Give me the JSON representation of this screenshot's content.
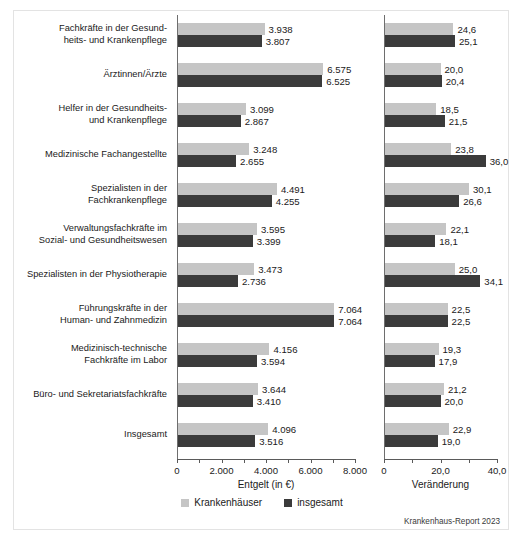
{
  "chart_data": {
    "type": "bar",
    "orientation": "horizontal",
    "title": "",
    "source": "Krankenhaus-Report 2023",
    "legend": {
      "position": "bottom-center",
      "entries": [
        {
          "name": "Krankenhäuser",
          "color": "#c5c5c5"
        },
        {
          "name": "insgesamt",
          "color": "#3b3b3b"
        }
      ]
    },
    "categories": [
      "Fachkräfte in der Gesund-\nheits- und Krankenpflege",
      "Ärztinnen/Ärzte",
      "Helfer in der Gesundheits-\nund Krankenpflege",
      "Medizinische Fachangestellte",
      "Spezialisten in der\nFachkrankenpflege",
      "Verwaltungsfachkräfte im\nSozial- und Gesundheitswesen",
      "Spezialisten in der Physiotherapie",
      "Führungskräfte in der\nHuman- und Zahnmedizin",
      "Medizinisch-technische\nFachkräfte im Labor",
      "Büro- und Sekretariatsfachkräfte",
      "Insgesamt"
    ],
    "panels": [
      {
        "id": "entgelt",
        "xlabel": "Entgelt (in €)",
        "xlim": [
          0,
          8000
        ],
        "major_ticks": [
          0,
          2000,
          4000,
          6000,
          8000
        ],
        "major_tick_labels": [
          "0",
          "2.000",
          "4.000",
          "6.000",
          "8.000"
        ],
        "minor_ticks": [
          1000,
          3000,
          5000,
          7000
        ],
        "grid": false,
        "series": [
          {
            "name": "Krankenhäuser",
            "color": "#c5c5c5",
            "values": [
              3938,
              6575,
              3099,
              3248,
              4491,
              3595,
              3473,
              7064,
              4156,
              3644,
              4096
            ],
            "labels": [
              "3.938",
              "6.575",
              "3.099",
              "3.248",
              "4.491",
              "3.595",
              "3.473",
              "7.064",
              "4.156",
              "3.644",
              "4.096"
            ]
          },
          {
            "name": "insgesamt",
            "color": "#3b3b3b",
            "values": [
              3807,
              6525,
              2867,
              2655,
              4255,
              3399,
              2736,
              7064,
              3594,
              3410,
              3516
            ],
            "labels": [
              "3.807",
              "6.525",
              "2.867",
              "2.655",
              "4.255",
              "3.399",
              "2.736",
              "7.064",
              "3.594",
              "3.410",
              "3.516"
            ]
          }
        ]
      },
      {
        "id": "veraenderung",
        "xlabel": "Veränderung",
        "xlim": [
          0,
          40
        ],
        "major_ticks": [
          0,
          20,
          40
        ],
        "major_tick_labels": [
          "0",
          "20,0",
          "40,0"
        ],
        "minor_ticks": [
          10,
          30
        ],
        "grid": false,
        "series": [
          {
            "name": "Krankenhäuser",
            "color": "#c5c5c5",
            "values": [
              24.6,
              20.0,
              18.5,
              23.8,
              30.1,
              22.1,
              25.0,
              22.5,
              19.3,
              21.2,
              22.9
            ],
            "labels": [
              "24,6",
              "20,0",
              "18,5",
              "23,8",
              "30,1",
              "22,1",
              "25,0",
              "22,5",
              "19,3",
              "21,2",
              "22,9"
            ]
          },
          {
            "name": "insgesamt",
            "color": "#3b3b3b",
            "values": [
              25.1,
              20.4,
              21.5,
              36.0,
              26.6,
              18.1,
              34.1,
              22.5,
              17.9,
              20.0,
              19.0
            ],
            "labels": [
              "25,1",
              "20,4",
              "21,5",
              "36,0",
              "26,6",
              "18,1",
              "34,1",
              "22,5",
              "17,9",
              "20,0",
              "19,0"
            ]
          }
        ]
      }
    ]
  }
}
